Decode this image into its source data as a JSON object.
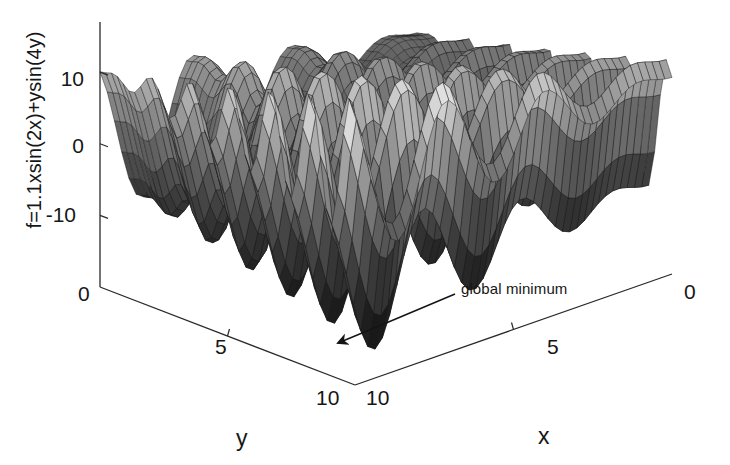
{
  "figure": {
    "kind": "3d-surface-mesh-plot",
    "style": "grayscale-halftone-mesh",
    "background_color": "#ffffff",
    "line_color": "#1a1a1a"
  },
  "labels": {
    "z_axis_title": "f=1.1xsin(2x)+ysin(4y)",
    "x_axis_title": "x",
    "y_axis_title": "y"
  },
  "annotation": {
    "text": "global minimum",
    "arrow": "leader-line-with-solid-arrowhead"
  },
  "ticks": {
    "z": [
      "10",
      "0",
      "-10"
    ],
    "y": [
      "0",
      "5",
      "10"
    ],
    "x": [
      "10",
      "5",
      "0"
    ]
  },
  "chart_data": {
    "type": "surface",
    "title": "",
    "function": "f = 1.1*x*sin(2*x) + y*sin(4*y)",
    "xlabel": "x",
    "ylabel": "y",
    "zlabel": "f=1.1xsin(2x)+ysin(4y)",
    "xlim": [
      0,
      10
    ],
    "ylim": [
      0,
      10
    ],
    "zlim": [
      -20,
      17
    ],
    "xticks": [
      0,
      5,
      10
    ],
    "yticks": [
      0,
      5,
      10
    ],
    "zticks": [
      -10,
      0,
      10
    ],
    "grid": false,
    "legend": null,
    "colormap": "gray",
    "mesh_n": 44,
    "view": {
      "azimuth": -37.5,
      "elevation": 22
    },
    "annotations": [
      {
        "text": "global minimum",
        "points_to": "lowest valley of surface"
      }
    ]
  }
}
